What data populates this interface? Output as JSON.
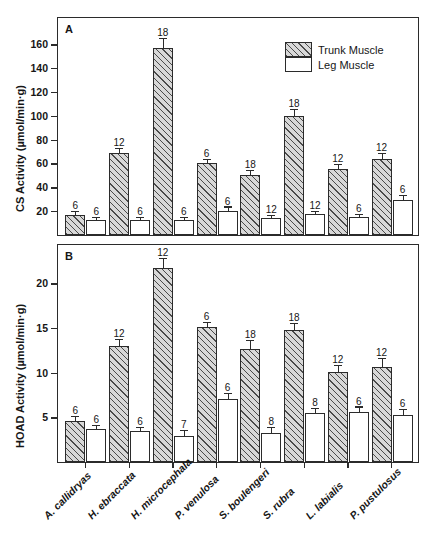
{
  "figure": {
    "width": 432,
    "height": 559,
    "background": "#ffffff",
    "ink_color": "#2b2b2b"
  },
  "legend": {
    "position": "top-right-inside-panel-A",
    "entries": [
      {
        "label": "Trunk Muscle",
        "swatch": "hatched-diagonal",
        "name": "trunk-muscle"
      },
      {
        "label": "Leg Muscle",
        "swatch": "open-white",
        "name": "leg-muscle"
      }
    ]
  },
  "panels": [
    {
      "letter": "A",
      "name": "panel-cs-activity",
      "ylabel": "CS Activity (µmol/min·g)",
      "yticks": [
        20,
        40,
        60,
        80,
        100,
        120,
        140,
        160
      ],
      "yticklabels": [
        "20",
        "40",
        "60",
        "80",
        "100",
        "120",
        "140",
        "160"
      ],
      "ylim": [
        0,
        182
      ]
    },
    {
      "letter": "B",
      "name": "panel-hoad-activity",
      "ylabel": "HOAD Activity (µmol/min·g)",
      "yticks": [
        5,
        10,
        15,
        20
      ],
      "yticklabels": [
        "5",
        "10",
        "15",
        "20"
      ],
      "ylim": [
        0,
        24.3
      ]
    }
  ],
  "categories": [
    "A. callidryas",
    "H. ebraccata",
    "H. microcephala",
    "P. venulosa",
    "S. boulengeri",
    "S. rubra",
    "L. labialis",
    "P. pustulosus"
  ],
  "chart_data": [
    {
      "type": "bar",
      "panel": "A",
      "title": "CS Activity",
      "xlabel": "",
      "ylabel": "CS Activity (µmol/min·g)",
      "ylim": [
        0,
        182
      ],
      "yticks": [
        20,
        40,
        60,
        80,
        100,
        120,
        140,
        160
      ],
      "grid": false,
      "legend_position": "top-right",
      "categories": [
        "A. callidryas",
        "H. ebraccata",
        "H. microcephala",
        "P. venulosa",
        "S. boulengeri",
        "S. rubra",
        "L. labialis",
        "P. pustulosus"
      ],
      "series": [
        {
          "name": "Trunk Muscle",
          "values": [
            16.5,
            69,
            157,
            60,
            50,
            100,
            55.5,
            64
          ],
          "errors": [
            3.0,
            3.0,
            7.0,
            3.0,
            4.0,
            5.0,
            3.5,
            4.0
          ],
          "n_labels": [
            "6",
            "12",
            "18",
            "6",
            "18",
            "18",
            "12",
            "12"
          ]
        },
        {
          "name": "Leg Muscle",
          "values": [
            12.5,
            12.5,
            12.5,
            20.5,
            14.5,
            17.5,
            15.0,
            29.5
          ],
          "errors": [
            1.5,
            1.5,
            2.0,
            2.5,
            1.5,
            2.0,
            1.5,
            3.0
          ],
          "n_labels": [
            "6",
            "6",
            "6",
            "6",
            "12",
            "12",
            "6",
            "6"
          ]
        }
      ]
    },
    {
      "type": "bar",
      "panel": "B",
      "title": "HOAD Activity",
      "xlabel": "",
      "ylabel": "HOAD Activity (µmol/min·g)",
      "ylim": [
        0,
        24.3
      ],
      "yticks": [
        5,
        10,
        15,
        20
      ],
      "grid": false,
      "legend_position": "none",
      "categories": [
        "A. callidryas",
        "H. ebraccata",
        "H. microcephala",
        "P. venulosa",
        "S. boulengeri",
        "S. rubra",
        "L. labialis",
        "P. pustulosus"
      ],
      "series": [
        {
          "name": "Trunk Muscle",
          "values": [
            4.6,
            13.0,
            21.7,
            15.1,
            12.6,
            14.8,
            10.1,
            10.6
          ],
          "errors": [
            0.45,
            0.7,
            1.0,
            0.45,
            0.9,
            0.7,
            0.6,
            0.9
          ],
          "n_labels": [
            "6",
            "12",
            "12",
            "6",
            "18",
            "18",
            "12",
            "12"
          ]
        },
        {
          "name": "Leg Muscle",
          "values": [
            3.7,
            3.5,
            2.9,
            7.1,
            3.3,
            5.5,
            5.6,
            5.3
          ],
          "errors": [
            0.35,
            0.35,
            0.6,
            0.55,
            0.5,
            0.45,
            0.5,
            0.55
          ],
          "n_labels": [
            "6",
            "6",
            "7",
            "6",
            "8",
            "8",
            "6",
            "6"
          ]
        }
      ]
    }
  ]
}
